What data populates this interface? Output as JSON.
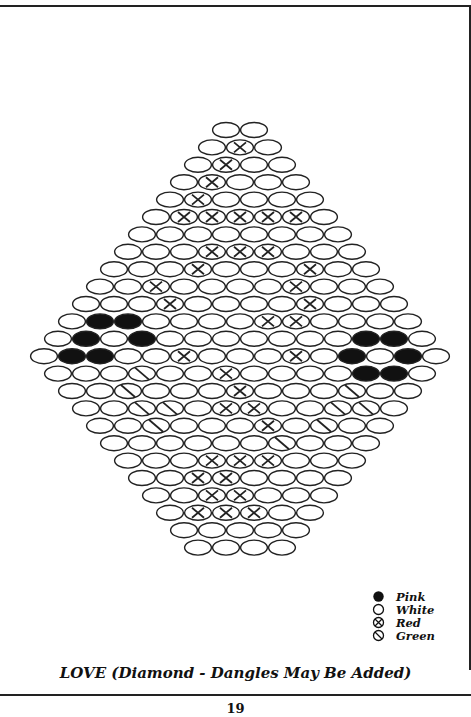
{
  "pattern": {
    "title": "LOVE (Diamond - Dangles May Be Added)",
    "page_number": "19",
    "bead_width": 28,
    "bead_height": 15,
    "center_x": 240,
    "top_y": 130,
    "row_spacing": 17.4,
    "rows": [
      "WW",
      "WXW",
      "WXWW",
      "WXWWW",
      "WXWWWW",
      "WXXXXXW",
      "WWWWWWWW",
      "WWWXXXWWW",
      "WWWXWWWXWW",
      "WWXWWWWXWWW",
      "WWWXWWWWXWWW",
      "WPPWWWWXXWWWW",
      "WPWPWWWWWWWPPW",
      "WPPWWXWWWXWPWPW",
      "WWWGWWXWWWWPPW",
      "WWGWWWXWWWGWW",
      "WWGGWXXWWGGW",
      "WWGWWWXWGWW",
      "WWWWWWGWWW",
      "WWWXXXWWW",
      "WWXXWWWW",
      "WWXXWWW",
      "WXXXWW",
      "WWWWW",
      "WWWW"
    ]
  },
  "legend": [
    {
      "key": "P",
      "label": "Pink",
      "symbol": "filled-circle"
    },
    {
      "key": "W",
      "label": "White",
      "symbol": "open-circle"
    },
    {
      "key": "X",
      "label": "Red",
      "symbol": "crossed-circle"
    },
    {
      "key": "G",
      "label": "Green",
      "symbol": "slashed-circle"
    }
  ],
  "colors": {
    "ink": "#111111",
    "paper": "#ffffff"
  }
}
